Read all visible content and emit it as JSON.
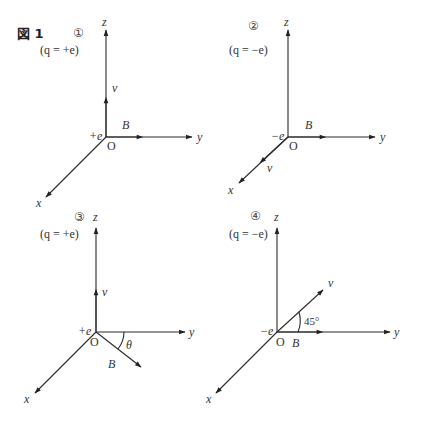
{
  "figure": {
    "title": "図 1",
    "origin_label": "O",
    "axis_labels": {
      "x": "x",
      "y": "y",
      "z": "z"
    },
    "panels": [
      {
        "number": "①",
        "condition": "(q = +e)",
        "charge_label": "+e",
        "v_label": "v⃗",
        "B_label": "B⃗",
        "v_direction": "+z",
        "B_direction": "+y"
      },
      {
        "number": "②",
        "condition": "(q = −e)",
        "charge_label": "−e",
        "v_label": "v⃗",
        "B_label": "B⃗",
        "v_direction": "+x",
        "B_direction": "+y"
      },
      {
        "number": "③",
        "condition": "(q = +e)",
        "charge_label": "+e",
        "v_label": "v⃗",
        "B_label": "B⃗",
        "angle_label": "θ",
        "v_direction": "+z",
        "B_direction": "xy-plane, angle θ from y-axis"
      },
      {
        "number": "④",
        "condition": "(q = −e)",
        "charge_label": "−e",
        "v_label": "v⃗",
        "B_label": "B⃗",
        "angle_label": "45°",
        "v_direction": "yz-like diagonal, 45° from y-axis",
        "B_direction": "+y"
      }
    ]
  }
}
